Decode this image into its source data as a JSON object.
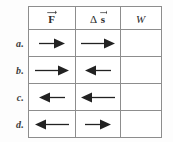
{
  "figure": {
    "kind": "physics-worksheet-table",
    "background_color": "#fdfdfd",
    "border_color": "#8d8d8d",
    "arrow_color": "#222222"
  },
  "table": {
    "columns": [
      {
        "key": "F",
        "label": "F",
        "symbol_style": "bold-vector",
        "has_vector_arrow": true,
        "has_delta": false
      },
      {
        "key": "ds",
        "label": "s",
        "symbol_style": "bold-vector",
        "has_vector_arrow": true,
        "has_delta": true,
        "delta": "Δ"
      },
      {
        "key": "W",
        "label": "W",
        "symbol_style": "italic",
        "has_vector_arrow": false,
        "has_delta": false
      }
    ],
    "column_header_text": [
      "F",
      "Δ s",
      "W"
    ],
    "rows": [
      {
        "label": "a.",
        "force": {
          "direction": "right",
          "length": "short",
          "length_px": 28
        },
        "displacement": {
          "direction": "right",
          "length": "long",
          "length_px": 36
        },
        "work": {
          "value": ""
        }
      },
      {
        "label": "b.",
        "force": {
          "direction": "right",
          "length": "long",
          "length_px": 36
        },
        "displacement": {
          "direction": "left",
          "length": "short",
          "length_px": 28
        },
        "work": {
          "value": ""
        }
      },
      {
        "label": "c.",
        "force": {
          "direction": "left",
          "length": "short",
          "length_px": 28
        },
        "displacement": {
          "direction": "left",
          "length": "long",
          "length_px": 36
        },
        "work": {
          "value": ""
        }
      },
      {
        "label": "d.",
        "force": {
          "direction": "left",
          "length": "long",
          "length_px": 36
        },
        "displacement": {
          "direction": "right",
          "length": "short",
          "length_px": 28
        },
        "work": {
          "value": ""
        }
      }
    ]
  }
}
